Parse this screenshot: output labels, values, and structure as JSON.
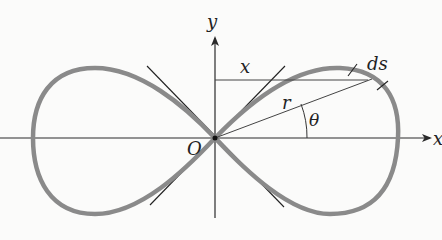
{
  "diagram": {
    "type": "lemniscate",
    "labels": {
      "x_axis": "x",
      "y_axis": "y",
      "origin": "O",
      "segment_x": "x",
      "radius": "r",
      "angle": "θ",
      "arc_element": "ds"
    },
    "colors": {
      "curve": "#8a8a8a",
      "axes": "#2a2a2a",
      "tangents": "#222222",
      "background": "#fbfbfa"
    }
  }
}
